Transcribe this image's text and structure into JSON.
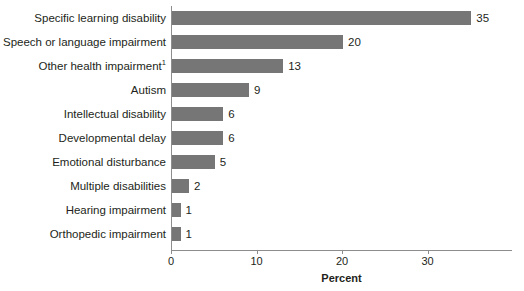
{
  "chart_data": {
    "type": "bar",
    "orientation": "horizontal",
    "title": "",
    "xlabel": "Percent",
    "ylabel": "",
    "xlim": [
      0,
      40
    ],
    "xticks": [
      0,
      10,
      20,
      30
    ],
    "xtick_labels": [
      "0",
      "10",
      "20",
      "30"
    ],
    "grid": false,
    "legend": false,
    "bar_color": "#767676",
    "categories": [
      "Specific learning disability",
      "Speech or language impairment",
      "Other health impairment",
      "Autism",
      "Intellectual disability",
      "Developmental delay",
      "Emotional disturbance",
      "Multiple disabilities",
      "Hearing impairment",
      "Orthopedic impairment"
    ],
    "values": [
      35,
      20,
      13,
      9,
      6,
      6,
      5,
      2,
      1,
      1
    ],
    "value_labels": [
      "35",
      "20",
      "13",
      "9",
      "6",
      "6",
      "5",
      "2",
      "1",
      "1"
    ],
    "footnote_markers": [
      "",
      "",
      "1",
      "",
      "",
      "",
      "",
      "",
      "",
      ""
    ],
    "rows": [
      {
        "label": "Specific learning disability",
        "footnote": "",
        "value": 35,
        "value_label": "35"
      },
      {
        "label": "Speech or language impairment",
        "footnote": "",
        "value": 20,
        "value_label": "20"
      },
      {
        "label": "Other health impairment",
        "footnote": "1",
        "value": 13,
        "value_label": "13"
      },
      {
        "label": "Autism",
        "footnote": "",
        "value": 9,
        "value_label": "9"
      },
      {
        "label": "Intellectual disability",
        "footnote": "",
        "value": 6,
        "value_label": "6"
      },
      {
        "label": "Developmental delay",
        "footnote": "",
        "value": 6,
        "value_label": "6"
      },
      {
        "label": "Emotional disturbance",
        "footnote": "",
        "value": 5,
        "value_label": "5"
      },
      {
        "label": "Multiple disabilities",
        "footnote": "",
        "value": 2,
        "value_label": "2"
      },
      {
        "label": "Hearing impairment",
        "footnote": "",
        "value": 1,
        "value_label": "1"
      },
      {
        "label": "Orthopedic impairment",
        "footnote": "",
        "value": 1,
        "value_label": "1"
      }
    ]
  }
}
